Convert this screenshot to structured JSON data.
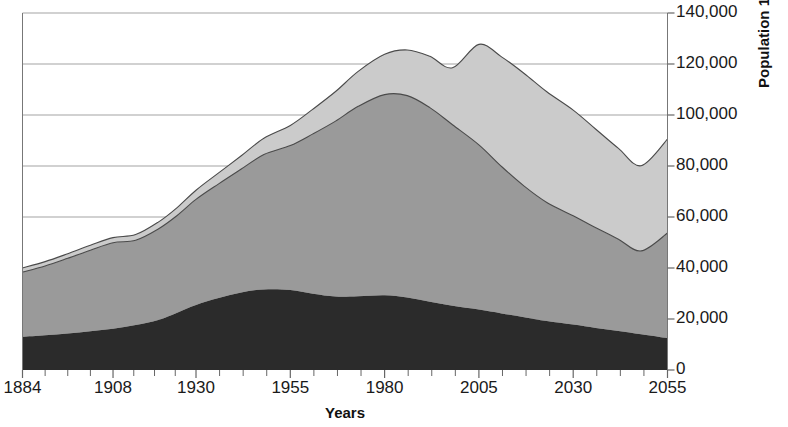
{
  "chart_data": {
    "type": "area",
    "title": "",
    "subtitle": "",
    "xlabel": "Years",
    "ylabel": "Population 1000s",
    "stacked": true,
    "grid": true,
    "grid_orientation": "horizontal",
    "legend": "none",
    "y_axis_position": "right",
    "xlim": [
      1884,
      2055
    ],
    "ylim": [
      0,
      140000
    ],
    "y_ticks": [
      0,
      20000,
      40000,
      60000,
      80000,
      100000,
      120000,
      140000
    ],
    "y_tick_labels": [
      "0",
      "20,000",
      "40,000",
      "60,000",
      "80,000",
      "100,000",
      "120,000",
      "140,000"
    ],
    "x_ticks": [
      1884,
      1908,
      1930,
      1955,
      1980,
      2005,
      2030,
      2055
    ],
    "x_tick_labels": [
      "1884",
      "1908",
      "1930",
      "1955",
      "1980",
      "2005",
      "2030",
      "2055"
    ],
    "x_minor_tick_count_between_majors": 3,
    "colors": {
      "series_bottom_fill": "#2b2b2b",
      "series_middle_fill": "#9a9a9a",
      "series_top_fill": "#cbcbcb",
      "series_outline": "#4a4a4a",
      "grid": "#999999",
      "axis": "#666666",
      "text": "#1a1a1a"
    },
    "x": [
      1884,
      1890,
      1896,
      1902,
      1908,
      1914,
      1920,
      1925,
      1930,
      1936,
      1942,
      1948,
      1955,
      1961,
      1967,
      1973,
      1980,
      1986,
      1992,
      1998,
      2005,
      2011,
      2017,
      2023,
      2030,
      2036,
      2042,
      2048,
      2055
    ],
    "series": [
      {
        "name": "series-bottom",
        "fill": "#2b2b2b",
        "values": [
          13000,
          13600,
          14300,
          15200,
          16200,
          17600,
          19600,
          22500,
          25500,
          28200,
          30400,
          31600,
          31400,
          29900,
          28800,
          28900,
          29300,
          28400,
          26800,
          25200,
          23700,
          22200,
          20700,
          19200,
          17800,
          16500,
          15300,
          14000,
          12500
        ]
      },
      {
        "name": "series-middle",
        "fill": "#9a9a9a",
        "values": [
          25400,
          27200,
          29500,
          31800,
          33700,
          33300,
          35700,
          38100,
          41400,
          44800,
          48400,
          52900,
          56600,
          62700,
          68800,
          74500,
          78700,
          79200,
          76100,
          71000,
          64600,
          57600,
          51400,
          46500,
          42700,
          39300,
          36000,
          32700,
          41200
        ]
      },
      {
        "name": "series-top",
        "fill": "#cbcbcb",
        "values": [
          1600,
          1700,
          1800,
          1900,
          2000,
          2200,
          2700,
          3100,
          3600,
          4300,
          5200,
          6400,
          7900,
          9700,
          11600,
          13700,
          15800,
          17900,
          20100,
          22300,
          39400,
          43000,
          44200,
          43400,
          41400,
          38600,
          35600,
          33400,
          36800
        ]
      }
    ],
    "stack_top_boundary_note": "Top of stacked area peaks near 127,800 around year 2005; middle boundary peaks near 109,000 around 1984; bottom series shows twin humps near 1942 and 1980.",
    "annotations": []
  }
}
